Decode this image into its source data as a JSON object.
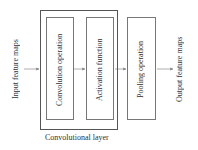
{
  "diagram": {
    "input_label": "Input feature maps",
    "output_label": "Output feature maps",
    "group_label": "Convolutional layer",
    "nodes": [
      {
        "id": "conv",
        "label": "Convolution operation"
      },
      {
        "id": "act",
        "label": "Activation function"
      },
      {
        "id": "pool",
        "label": "Pooling operation"
      }
    ],
    "edges": [
      {
        "from": "input",
        "to": "conv"
      },
      {
        "from": "conv",
        "to": "act"
      },
      {
        "from": "act",
        "to": "pool"
      },
      {
        "from": "pool",
        "to": "output"
      }
    ],
    "colors": {
      "line": "#777777",
      "text": "#333333"
    }
  }
}
